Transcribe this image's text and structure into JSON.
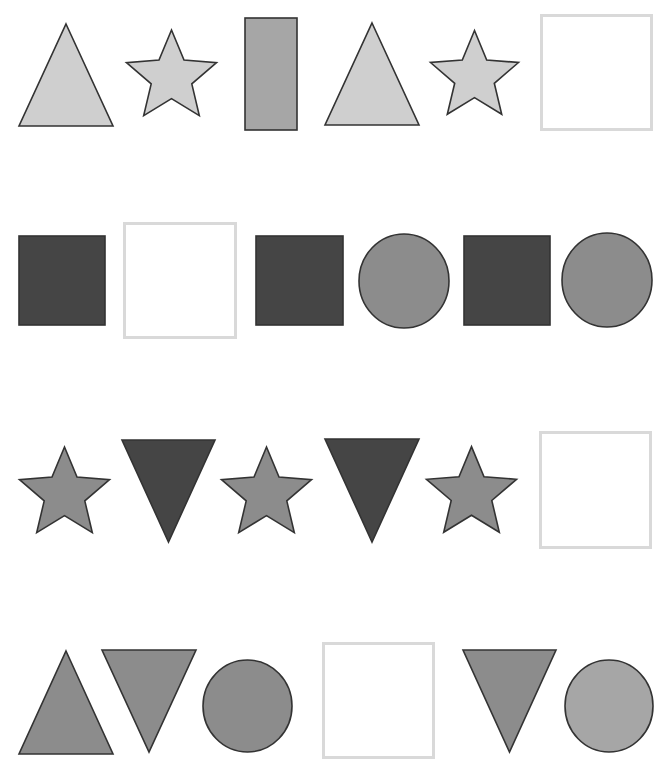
{
  "colors": {
    "light": "#cfcfcf",
    "medium": "#a6a6a6",
    "mid_dark": "#8c8c8c",
    "dark": "#454545",
    "stroke": "#333333",
    "answer_border": "#d9d9d9"
  },
  "rows": [
    {
      "name": "row-1",
      "items": [
        {
          "type": "triangle",
          "fill": "light",
          "x": 19,
          "y": 24,
          "w": 94,
          "h": 102
        },
        {
          "type": "star",
          "fill": "light",
          "x": 126,
          "y": 27,
          "w": 91,
          "h": 95
        },
        {
          "type": "rect",
          "fill": "medium",
          "x": 245,
          "y": 18,
          "w": 52,
          "h": 112
        },
        {
          "type": "triangle",
          "fill": "light",
          "x": 325,
          "y": 23,
          "w": 94,
          "h": 102
        },
        {
          "type": "star",
          "fill": "light",
          "x": 430,
          "y": 27,
          "w": 89,
          "h": 94
        },
        {
          "type": "answer",
          "x": 540,
          "y": 14,
          "w": 113,
          "h": 117
        }
      ]
    },
    {
      "name": "row-2",
      "items": [
        {
          "type": "rect",
          "fill": "dark",
          "x": 19,
          "y": 236,
          "w": 86,
          "h": 89
        },
        {
          "type": "answer",
          "x": 123,
          "y": 222,
          "w": 114,
          "h": 117
        },
        {
          "type": "rect",
          "fill": "dark",
          "x": 256,
          "y": 236,
          "w": 87,
          "h": 89
        },
        {
          "type": "circle",
          "fill": "mid_dark",
          "x": 359,
          "y": 234,
          "w": 90,
          "h": 94
        },
        {
          "type": "rect",
          "fill": "dark",
          "x": 464,
          "y": 236,
          "w": 86,
          "h": 89
        },
        {
          "type": "circle",
          "fill": "mid_dark",
          "x": 562,
          "y": 233,
          "w": 90,
          "h": 94
        }
      ]
    },
    {
      "name": "row-3",
      "items": [
        {
          "type": "star",
          "fill": "mid_dark",
          "x": 19,
          "y": 444,
          "w": 91,
          "h": 95
        },
        {
          "type": "inv-triangle",
          "fill": "dark",
          "x": 122,
          "y": 440,
          "w": 93,
          "h": 102
        },
        {
          "type": "star",
          "fill": "mid_dark",
          "x": 221,
          "y": 444,
          "w": 91,
          "h": 95
        },
        {
          "type": "inv-triangle",
          "fill": "dark",
          "x": 325,
          "y": 439,
          "w": 94,
          "h": 103
        },
        {
          "type": "star",
          "fill": "mid_dark",
          "x": 426,
          "y": 443,
          "w": 91,
          "h": 96
        },
        {
          "type": "answer",
          "x": 539,
          "y": 431,
          "w": 113,
          "h": 118
        }
      ]
    },
    {
      "name": "row-4",
      "items": [
        {
          "type": "triangle",
          "fill": "mid_dark",
          "x": 19,
          "y": 651,
          "w": 94,
          "h": 103
        },
        {
          "type": "inv-triangle",
          "fill": "mid_dark",
          "x": 102,
          "y": 650,
          "w": 94,
          "h": 102
        },
        {
          "type": "circle",
          "fill": "mid_dark",
          "x": 203,
          "y": 660,
          "w": 89,
          "h": 92
        },
        {
          "type": "answer",
          "x": 322,
          "y": 642,
          "w": 113,
          "h": 117
        },
        {
          "type": "inv-triangle",
          "fill": "mid_dark",
          "x": 463,
          "y": 650,
          "w": 93,
          "h": 102
        },
        {
          "type": "circle",
          "fill": "medium",
          "x": 565,
          "y": 660,
          "w": 88,
          "h": 92
        }
      ]
    }
  ]
}
